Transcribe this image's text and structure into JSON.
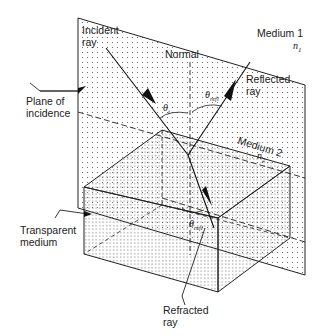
{
  "diagram": {
    "type": "refraction-geometry",
    "labels": {
      "incident_ray": [
        "Incident",
        "ray"
      ],
      "normal": "Normal",
      "medium1": "Medium 1",
      "n1": "n",
      "n1_sub": "1",
      "reflected_ray": [
        "Reflected",
        "ray"
      ],
      "plane_of_incidence": [
        "Plane of",
        "incidence"
      ],
      "medium2": "Medium 2",
      "n2": "n",
      "n2_sub": "2",
      "transparent_medium": [
        "Transparent",
        "medium"
      ],
      "refracted_ray": [
        "Refracted",
        "ray"
      ],
      "theta_i": "θ",
      "theta_i_sub": "i",
      "theta_refl": "θ",
      "theta_refl_sub": "refl",
      "theta_refr": "θ",
      "theta_refr_sub": "refl"
    },
    "colors": {
      "line": "#222222",
      "dots": "#555555",
      "background": "#ffffff"
    }
  }
}
